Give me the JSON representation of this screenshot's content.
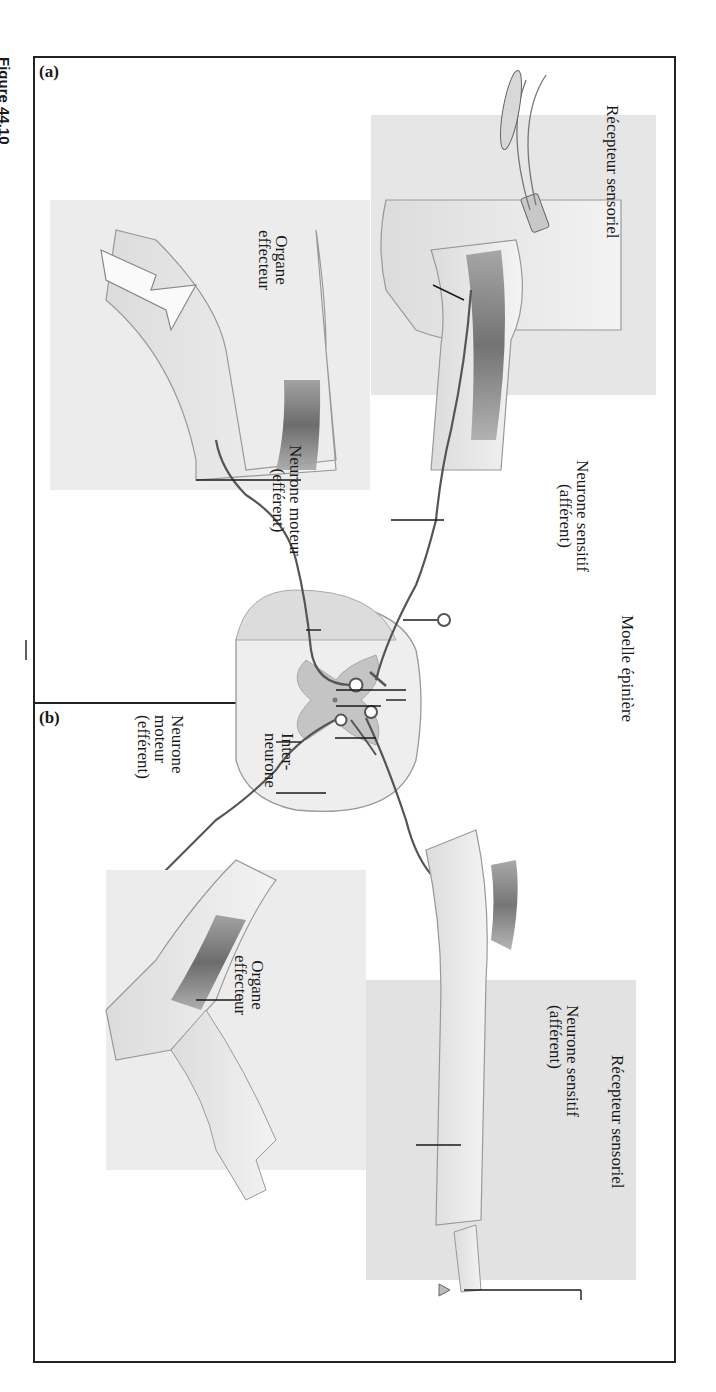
{
  "figure": {
    "caption": "Figure 44.10",
    "panels": [
      {
        "tag": "(a)",
        "labels": {
          "sensory_receptor": "Récepteur sensoriel",
          "sensory_neuron_line1": "Neurone sensitif",
          "sensory_neuron_line2": "(afférent)",
          "spinal_cord": "Moelle épinière",
          "motor_neuron_line1": "Neurone moteur",
          "motor_neuron_line2": "(efférent)",
          "effector_line1": "Organe",
          "effector_line2": "effecteur"
        }
      },
      {
        "tag": "(b)",
        "labels": {
          "interneuron_line1": "Inter-",
          "interneuron_line2": "neurone",
          "motor_neuron_line1": "Neurone",
          "motor_neuron_line2": "moteur",
          "motor_neuron_line3": "(efférent)",
          "effector_line1": "Organe",
          "effector_line2": "effecteur",
          "sensory_neuron_line1": "Neurone sensitif",
          "sensory_neuron_line2": "(afférent)",
          "sensory_receptor": "Récepteur sensoriel"
        }
      }
    ]
  }
}
